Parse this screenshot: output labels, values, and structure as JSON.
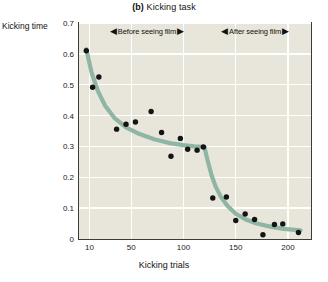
{
  "figure": {
    "panel_label": "(b)",
    "title_text": "Kicking task",
    "full_title": "(b) Kicking task"
  },
  "colors": {
    "plot_background": "#e8e6da",
    "gridline": "#ffffff",
    "curve": "#8fb5a4",
    "point": "#141414",
    "frame": "#3b3b38",
    "text": "#1a1a1a",
    "page_background": "#ffffff"
  },
  "annotations": [
    {
      "label": "Before seeing film",
      "arrow_left": "◀",
      "arrow_right": "▶",
      "x_start": 10,
      "x_end": 120
    },
    {
      "label": "After seeing film",
      "arrow_left": "◀",
      "arrow_right": "▶",
      "x_start": 122,
      "x_end": 215
    }
  ],
  "chart_data": {
    "type": "scatter",
    "title": "(b) Kicking task",
    "xlabel": "Kicking trials",
    "ylabel": "Kicking time",
    "xlim": [
      0,
      222
    ],
    "ylim": [
      0,
      0.7
    ],
    "grid": true,
    "legend_position": "none",
    "xticks": [
      10,
      50,
      100,
      150,
      200
    ],
    "xtick_labels": [
      "10",
      "50",
      "100",
      "150",
      "200"
    ],
    "yticks": [
      0,
      0.1,
      0.2,
      0.3,
      0.4,
      0.5,
      0.6,
      0.7
    ],
    "ytick_labels": [
      "0",
      "0.1",
      "0.2",
      "0.3",
      "0.4",
      "0.5",
      "0.6",
      "0.7"
    ],
    "series": [
      {
        "name": "Kicking time per trial",
        "marker": "filled-circle",
        "x": [
          7,
          13,
          19,
          36,
          45,
          54,
          69,
          79,
          88,
          97,
          104,
          113,
          119,
          128,
          141,
          150,
          159,
          168,
          176,
          187,
          195,
          210
        ],
        "y": [
          0.61,
          0.492,
          0.525,
          0.356,
          0.372,
          0.379,
          0.413,
          0.345,
          0.268,
          0.326,
          0.291,
          0.288,
          0.298,
          0.133,
          0.136,
          0.06,
          0.081,
          0.063,
          0.014,
          0.047,
          0.049,
          0.021
        ]
      }
    ],
    "fit_curve": {
      "name": "Fitted learning curve",
      "description": "Two-segment power-law fit with a discontinuous drop at trial 120",
      "segment_before": {
        "x": [
          7,
          12,
          18,
          25,
          34,
          45,
          58,
          72,
          88,
          100,
          110,
          118,
          120
        ],
        "y": [
          0.615,
          0.54,
          0.48,
          0.432,
          0.392,
          0.362,
          0.34,
          0.323,
          0.31,
          0.304,
          0.3,
          0.299,
          0.298
        ]
      },
      "segment_after": {
        "x": [
          120,
          123,
          127,
          131,
          136,
          142,
          150,
          159,
          170,
          183,
          196,
          212
        ],
        "y": [
          0.298,
          0.255,
          0.205,
          0.168,
          0.135,
          0.108,
          0.082,
          0.064,
          0.05,
          0.04,
          0.033,
          0.028
        ]
      }
    }
  }
}
